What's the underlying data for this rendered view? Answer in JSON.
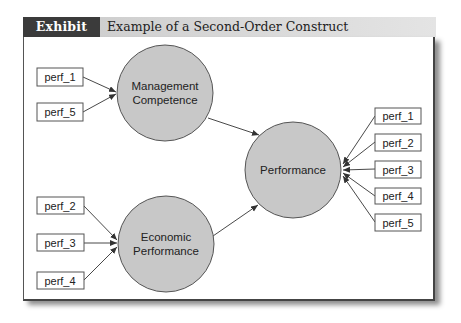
{
  "exhibit": {
    "label": "Exhibit 5.5",
    "title": "Example of a Second-Order Construct"
  },
  "colors": {
    "label_bg": "#3b3b3b",
    "construct_fill": "#c8c8c8",
    "construct_stroke": "#555555",
    "arrow": "#333333"
  },
  "constructs": {
    "management": {
      "line1": "Management",
      "line2": "Competence"
    },
    "economic": {
      "line1": "Economic",
      "line2": "Performance"
    },
    "performance": {
      "label": "Performance"
    }
  },
  "indicators": {
    "management": [
      "perf_1",
      "perf_5"
    ],
    "economic": [
      "perf_2",
      "perf_3",
      "perf_4"
    ],
    "performance": [
      "perf_1",
      "perf_2",
      "perf_3",
      "perf_4",
      "perf_5"
    ]
  }
}
